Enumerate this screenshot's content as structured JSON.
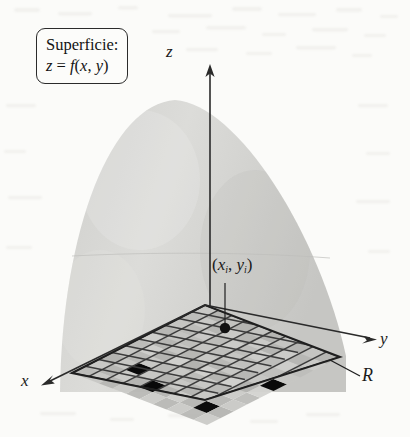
{
  "figure": {
    "background_color": "#fbfbf9"
  },
  "callout": {
    "name": "surface-callout",
    "line1": "Superficie:",
    "line2_lhs": "z",
    "line2_eq": " = ",
    "line2_rhs": "f",
    "line2_args_open": "(",
    "line2_arg1": "x",
    "line2_comma": ", ",
    "line2_arg2": "y",
    "line2_args_close": ")",
    "border_color": "#2b2b2b"
  },
  "axes": {
    "z": {
      "label": "z",
      "direction": "up"
    },
    "y": {
      "label": "y",
      "direction": "right"
    },
    "x": {
      "label": "x",
      "direction": "down-left"
    },
    "color": "#2a2a2a"
  },
  "annotations": {
    "sample_point": {
      "open_paren": "(",
      "x_var": "x",
      "x_sub": "i",
      "comma": ", ",
      "y_var": "y",
      "y_sub": "i",
      "close_paren": ")"
    },
    "region": {
      "label": "R",
      "description": "region rectangular en el plano xy"
    }
  },
  "surface": {
    "name": "paraboloid-dome",
    "fill_color": "#d4d4d2",
    "apex": {
      "x": 175,
      "y": 100
    }
  },
  "grid": {
    "name": "region-grid",
    "columns": 10,
    "rows": 10,
    "line_color": "#3a3a3a",
    "cell_light": "#c9c9c6",
    "cell_dark": "#a8a8a5",
    "corners": {
      "west": {
        "x": 72,
        "y": 373
      },
      "north": {
        "x": 205,
        "y": 305
      },
      "east": {
        "x": 340,
        "y": 357
      },
      "south": {
        "x": 205,
        "y": 400
      }
    }
  },
  "marker": {
    "name": "sample-point-dot",
    "x": 225,
    "y": 328,
    "color": "#111111"
  }
}
